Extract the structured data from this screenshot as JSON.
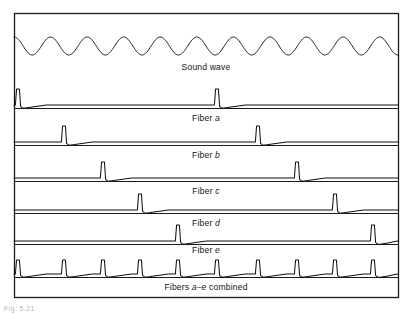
{
  "figure": {
    "title_visible": false,
    "caption_stub": "Fig. 5.21",
    "background_color": "#ffffff",
    "ink_color": "#111111",
    "frame": {
      "x": 14,
      "y": 13,
      "width": 384,
      "height": 284
    }
  },
  "rows": [
    {
      "id": "sound-wave",
      "label_plain": "Sound wave",
      "label_parts": [
        {
          "text": "Sound wave",
          "italic": false
        }
      ],
      "type": "sine",
      "baseline_y": 46,
      "amplitude": 9,
      "cycles": 10.5,
      "label_y": 70
    },
    {
      "id": "fiber-a",
      "label_plain": "Fiber a",
      "label_parts": [
        {
          "text": "Fiber ",
          "italic": false
        },
        {
          "text": "a",
          "italic": true
        }
      ],
      "type": "spikes",
      "baseline_y": 105,
      "spike_height": 16,
      "spike_positions": [
        18,
        217
      ],
      "label_y": 121
    },
    {
      "id": "fiber-b",
      "label_plain": "Fiber b",
      "label_parts": [
        {
          "text": "Fiber ",
          "italic": false
        },
        {
          "text": "b",
          "italic": true
        }
      ],
      "type": "spikes",
      "baseline_y": 142,
      "spike_height": 16,
      "spike_positions": [
        64,
        258
      ],
      "label_y": 158
    },
    {
      "id": "fiber-c",
      "label_plain": "Fiber c",
      "label_parts": [
        {
          "text": "Fiber ",
          "italic": false
        },
        {
          "text": "c",
          "italic": true
        }
      ],
      "type": "spikes",
      "baseline_y": 178,
      "spike_height": 16,
      "spike_positions": [
        103,
        297
      ],
      "label_y": 194
    },
    {
      "id": "fiber-d",
      "label_plain": "Fiber d",
      "label_parts": [
        {
          "text": "Fiber ",
          "italic": false
        },
        {
          "text": "d",
          "italic": true
        }
      ],
      "type": "spikes",
      "baseline_y": 210,
      "spike_height": 16,
      "spike_positions": [
        140,
        335
      ],
      "label_y": 226
    },
    {
      "id": "fiber-e",
      "label_plain": "Fiber e",
      "label_parts": [
        {
          "text": "Fiber ",
          "italic": false
        },
        {
          "text": "e",
          "italic": true
        }
      ],
      "type": "spikes",
      "baseline_y": 241,
      "spike_height": 16,
      "spike_positions": [
        178,
        373
      ],
      "label_y": 253
    },
    {
      "id": "fibers-combined",
      "label_plain": "Fibers a–e combined",
      "label_parts": [
        {
          "text": "Fibers ",
          "italic": false
        },
        {
          "text": "a–e",
          "italic": true
        },
        {
          "text": " combined",
          "italic": false
        }
      ],
      "type": "spikes",
      "baseline_y": 274,
      "spike_height": 14,
      "spike_positions": [
        18,
        64,
        103,
        140,
        178,
        217,
        258,
        297,
        335,
        373
      ],
      "label_y": 290
    }
  ],
  "dividers_y": [
    108,
    145,
    181,
    213,
    244,
    277
  ],
  "chart_data": {
    "type": "line",
    "xlabel": "",
    "ylabel": "",
    "x_range": [
      14,
      398
    ],
    "grid": false,
    "legend_position": "inline-row-labels",
    "series": [
      {
        "name": "Sound wave",
        "kind": "sine",
        "cycles": 10.5,
        "amplitude": 9,
        "baseline": 46
      },
      {
        "name": "Fiber a",
        "kind": "spike-train",
        "spike_x": [
          18,
          217
        ],
        "baseline": 105
      },
      {
        "name": "Fiber b",
        "kind": "spike-train",
        "spike_x": [
          64,
          258
        ],
        "baseline": 142
      },
      {
        "name": "Fiber c",
        "kind": "spike-train",
        "spike_x": [
          103,
          297
        ],
        "baseline": 178
      },
      {
        "name": "Fiber d",
        "kind": "spike-train",
        "spike_x": [
          140,
          335
        ],
        "baseline": 210
      },
      {
        "name": "Fiber e",
        "kind": "spike-train",
        "spike_x": [
          178,
          373
        ],
        "baseline": 241
      },
      {
        "name": "Fibers a–e combined",
        "kind": "spike-train",
        "spike_x": [
          18,
          64,
          103,
          140,
          178,
          217,
          258,
          297,
          335,
          373
        ],
        "baseline": 274
      }
    ]
  }
}
